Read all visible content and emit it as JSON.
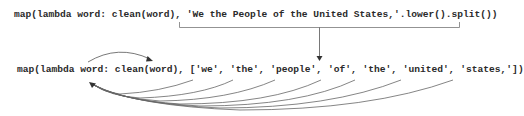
{
  "diagram": {
    "line1": {
      "text": "map(lambda word: clean(word), 'We the People of the United States,'.lower().split())"
    },
    "line2": {
      "text": "map(lambda word: clean(word), ['we', 'the', 'people', 'of', 'the', 'united', 'states,'])"
    },
    "list_items": [
      "'we'",
      "'the'",
      "'people'",
      "'of'",
      "'the'",
      "'united'",
      "'states,'"
    ],
    "annotations": {
      "bracket": "brace under string expression on line 1",
      "down_arrow": "evaluated string expression becomes list on line 2",
      "top_arc": "word parameter passed into clean(word)",
      "curved_arrows": "each list element flows back into lambda parameter 'word'"
    },
    "colors": {
      "text": "#2a2a2a",
      "lines": "#6a6a6a"
    }
  }
}
